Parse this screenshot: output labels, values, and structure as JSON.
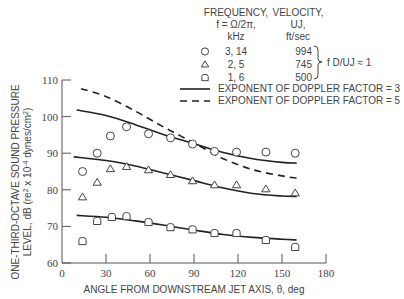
{
  "chart_data": {
    "type": "scatter",
    "title": "",
    "xlabel": "ANGLE FROM DOWNSTREAM JET AXIS, θ, deg",
    "ylabel_line1": "ONE-THIRD-OCTAVE SOUND PRESSURE",
    "ylabel_line2": "LEVEL, dB (re2 x 10-4 dynes/cm2)",
    "xlim": [
      0,
      180
    ],
    "ylim": [
      60,
      110
    ],
    "xticks": [
      0,
      30,
      60,
      90,
      120,
      150,
      180
    ],
    "yticks": [
      60,
      70,
      80,
      90,
      100,
      110
    ],
    "grid": false,
    "legend": {
      "position": "upper right",
      "header": {
        "col1": [
          "FREQUENCY,",
          "f = Ω/2π,",
          "kHz"
        ],
        "col2": [
          "VELOCITY,",
          "UJ,",
          "ft/sec"
        ]
      },
      "entries": [
        {
          "marker": "circle",
          "frequency": "3.14",
          "velocity": "994"
        },
        {
          "marker": "triangle",
          "frequency": "2.5",
          "velocity": "745"
        },
        {
          "marker": "rounded-square",
          "frequency": "1.6",
          "velocity": "500"
        }
      ],
      "brace_label": "f D/UJ ≈ 1",
      "lines": [
        {
          "style": "solid",
          "label": "EXPONENT OF DOPPLER FACTOR = 3"
        },
        {
          "style": "dashed",
          "label": "EXPONENT OF DOPPLER FACTOR = 5"
        }
      ]
    },
    "series": [
      {
        "name": "3.14 kHz, 994 ft/sec",
        "marker": "circle",
        "x": [
          14,
          24,
          33,
          44,
          59,
          74,
          89,
          104,
          119,
          139,
          159
        ],
        "y": [
          85,
          90,
          94.7,
          97.2,
          95.3,
          94.2,
          92.5,
          90.5,
          90.3,
          90.3,
          90
        ]
      },
      {
        "name": "2.5 kHz, 745 ft/sec",
        "marker": "triangle",
        "x": [
          14,
          24,
          33,
          44,
          59,
          74,
          89,
          104,
          119,
          139,
          159
        ],
        "y": [
          78,
          82,
          85.7,
          86.3,
          85.4,
          84.1,
          82.4,
          81.3,
          81.3,
          80.2,
          79.1
        ]
      },
      {
        "name": "1.6 kHz, 500 ft/sec",
        "marker": "rounded-square",
        "x": [
          14,
          24,
          34,
          44,
          59,
          74,
          89,
          104,
          119,
          139,
          159
        ],
        "y": [
          66,
          71.5,
          72.6,
          72.8,
          71.2,
          69.8,
          69.2,
          68.2,
          68.2,
          66.3,
          64.4
        ]
      }
    ],
    "curves": [
      {
        "name": "Doppler exponent 3 (upper)",
        "style": "solid",
        "x": [
          10,
          30,
          50,
          70,
          90,
          110,
          130,
          150,
          160
        ],
        "y": [
          101.8,
          100.3,
          97.8,
          95,
          92.6,
          90.2,
          88.5,
          87.5,
          87.3
        ]
      },
      {
        "name": "Doppler exponent 5 (upper)",
        "style": "dashed",
        "x": [
          13,
          30,
          50,
          70,
          90,
          110,
          130,
          150,
          160
        ],
        "y": [
          107.6,
          105.5,
          101.5,
          97,
          92.8,
          88.5,
          85.5,
          83.8,
          83.2
        ]
      },
      {
        "name": "Doppler exponent 3 (middle)",
        "style": "solid",
        "x": [
          8,
          30,
          50,
          70,
          90,
          110,
          130,
          150,
          160
        ],
        "y": [
          89,
          88,
          86.5,
          84.5,
          82.5,
          80.5,
          79,
          78.3,
          78.2
        ]
      },
      {
        "name": "Doppler exponent 3 (lower)",
        "style": "solid",
        "x": [
          10,
          30,
          50,
          70,
          90,
          110,
          130,
          150,
          160
        ],
        "y": [
          73,
          72.5,
          71.5,
          70.3,
          69,
          67.8,
          67,
          66.5,
          66.3
        ]
      }
    ]
  }
}
